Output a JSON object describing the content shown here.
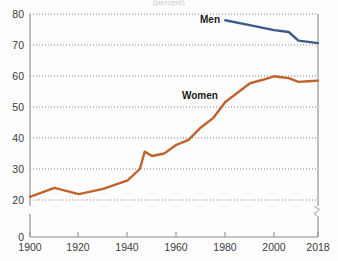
{
  "title_fragment": "(percent)",
  "chart_data": {
    "type": "line",
    "title": "",
    "subtitle": "",
    "xlabel": "",
    "ylabel": "",
    "xlim": [
      1900,
      2018
    ],
    "ylim": [
      20,
      80
    ],
    "y_axis_break": true,
    "y_zero_shown": true,
    "grid": "horizontal-dotted",
    "legend_position": "inline-labels",
    "x_ticks": [
      1900,
      1920,
      1940,
      1960,
      1980,
      2000,
      2018
    ],
    "x_tick_labels": [
      "1900",
      "1920",
      "1940",
      "1960",
      "1980",
      "2000",
      "2018"
    ],
    "y_ticks": [
      0,
      20,
      30,
      40,
      50,
      60,
      70,
      80
    ],
    "y_tick_labels": [
      "0",
      "20",
      "30",
      "40",
      "50",
      "60",
      "70",
      "80"
    ],
    "series": [
      {
        "name": "Men",
        "color": "#3c5a8a",
        "label_text": "Men",
        "x": [
          1980,
          1990,
          2000,
          2006,
          2010,
          2014,
          2018
        ],
        "values": [
          78.0,
          76.4,
          74.8,
          74.2,
          71.4,
          71.0,
          70.6
        ]
      },
      {
        "name": "Women",
        "color": "#c0632d",
        "label_text": "Women",
        "x": [
          1900,
          1910,
          1920,
          1930,
          1940,
          1945,
          1947,
          1950,
          1955,
          1960,
          1965,
          1970,
          1975,
          1980,
          1985,
          1990,
          1995,
          2000,
          2003,
          2006,
          2010,
          2014,
          2018
        ],
        "values": [
          21.0,
          23.9,
          21.9,
          23.6,
          26.3,
          30.0,
          35.6,
          34.2,
          35.0,
          37.8,
          39.4,
          43.4,
          46.4,
          51.6,
          54.6,
          57.6,
          58.7,
          59.9,
          59.6,
          59.3,
          58.1,
          58.3,
          58.5
        ]
      }
    ]
  }
}
